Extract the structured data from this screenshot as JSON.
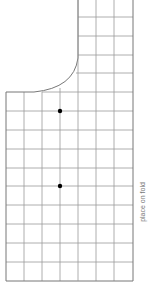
{
  "diagram": {
    "type": "sewing pattern piece on grid",
    "grid": {
      "columns": 7,
      "left": 6,
      "right": 133,
      "bottom": 281,
      "row_step": 18.75,
      "line_color": "#888888",
      "outline_color": "#777777"
    },
    "markers": [
      {
        "name": "notch-dot-1",
        "x": 60,
        "y": 111,
        "color": "#000000"
      },
      {
        "name": "notch-dot-2",
        "x": 60,
        "y": 186,
        "color": "#000000"
      }
    ],
    "fold_label": "place on fold"
  }
}
